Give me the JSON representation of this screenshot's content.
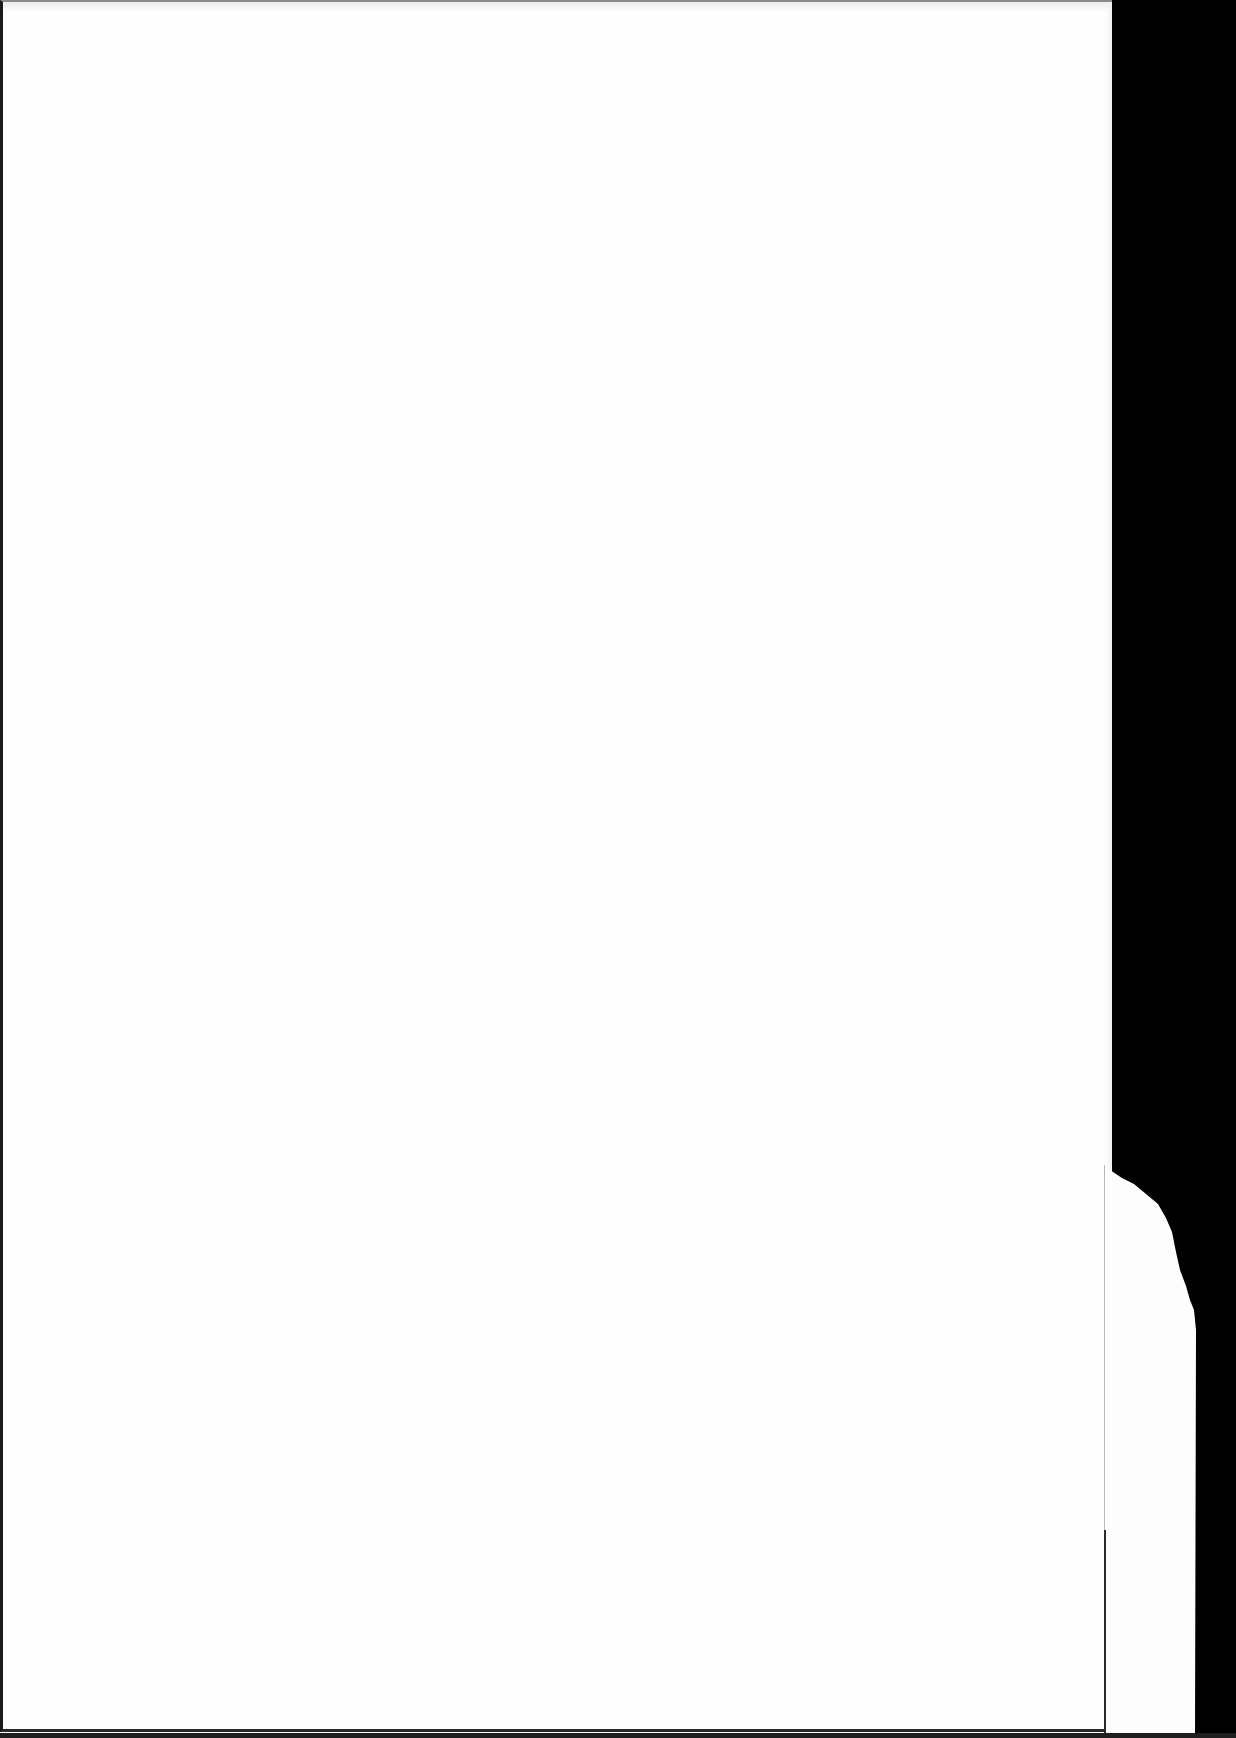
{
  "document": {
    "type": "scanned-page",
    "content": "",
    "is_blank": true
  },
  "colors": {
    "paper": "#fefefe",
    "backdrop": "#000000",
    "border": "#1a1a1a"
  }
}
